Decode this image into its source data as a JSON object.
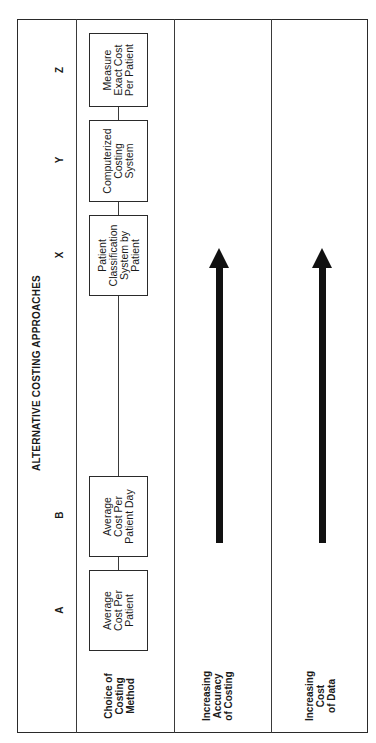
{
  "diagram": {
    "title": "ALTERNATIVE COSTING APPROACHES",
    "rows": [
      {
        "label": "Choice of\nCosting\nMethod"
      },
      {
        "label": "Increasing\nAccuracy\nof Costing"
      },
      {
        "label": "Increasing\nCost\nof Data"
      }
    ],
    "approaches": [
      {
        "letter": "A",
        "box": "Average\nCost Per\nPatient"
      },
      {
        "letter": "B",
        "box": "Average\nCost Per\nPatient Day"
      },
      {
        "letter": "X",
        "box": "Patient\nClassification\nSystem by\nPatient"
      },
      {
        "letter": "Y",
        "box": "Computerized\nCosting\nSystem"
      },
      {
        "letter": "Z",
        "box": "Measure\nExact Cost\nPer Patient"
      }
    ],
    "arrows": [
      {
        "row": "Increasing Accuracy of Costing",
        "direction": "toward Z"
      },
      {
        "row": "Increasing Cost of Data",
        "direction": "toward Z"
      }
    ],
    "orientation": "rotated 90 degrees counter-clockwise"
  }
}
